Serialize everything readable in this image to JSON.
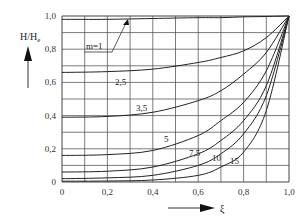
{
  "chart_data": {
    "type": "line",
    "title": "",
    "xlabel": "ξ",
    "ylabel": "H/He",
    "xlim": [
      0,
      1.0
    ],
    "ylim": [
      0,
      1.0
    ],
    "grid": true,
    "x_ticks": [
      "0",
      "0,2",
      "0,4",
      "0,6",
      "0,8",
      "1,0"
    ],
    "y_ticks": [
      "0",
      "0,2",
      "0,4",
      "0,6",
      "0,8",
      "1,0"
    ],
    "x": [
      0,
      0.2,
      0.4,
      0.6,
      0.7,
      0.8,
      0.9,
      1.0
    ],
    "series": [
      {
        "name": "m=1",
        "values": [
          0.98,
          0.98,
          0.985,
          0.99,
          0.99,
          0.995,
          0.997,
          1.0
        ]
      },
      {
        "name": "2,5",
        "values": [
          0.66,
          0.665,
          0.68,
          0.72,
          0.75,
          0.79,
          0.87,
          1.0
        ]
      },
      {
        "name": "3,5",
        "values": [
          0.39,
          0.395,
          0.42,
          0.49,
          0.55,
          0.65,
          0.78,
          1.0
        ]
      },
      {
        "name": "5",
        "values": [
          0.16,
          0.165,
          0.19,
          0.28,
          0.37,
          0.48,
          0.67,
          1.0
        ]
      },
      {
        "name": "7,5",
        "values": [
          0.06,
          0.065,
          0.09,
          0.17,
          0.25,
          0.37,
          0.58,
          1.0
        ]
      },
      {
        "name": "10",
        "values": [
          0.02,
          0.025,
          0.04,
          0.1,
          0.17,
          0.29,
          0.52,
          1.0
        ]
      },
      {
        "name": "15",
        "values": [
          0.005,
          0.006,
          0.012,
          0.04,
          0.09,
          0.18,
          0.43,
          1.0
        ]
      }
    ],
    "annotations": [
      {
        "text": "m=1",
        "note": "label with arrow pointing to top curve"
      },
      {
        "text": "2,5"
      },
      {
        "text": "3,5"
      },
      {
        "text": "5"
      },
      {
        "text": "7,5"
      },
      {
        "text": "10"
      },
      {
        "text": "15"
      }
    ],
    "legend": "none (inline curve labels)"
  },
  "labels": {
    "y_axis": "H/H",
    "y_axis_sub": "e",
    "x_axis": "ξ",
    "m1": "m=1",
    "c25": "2,5",
    "c35": "3,5",
    "c5": "5",
    "c75": "7,5",
    "c10": "10",
    "c15": "15"
  }
}
